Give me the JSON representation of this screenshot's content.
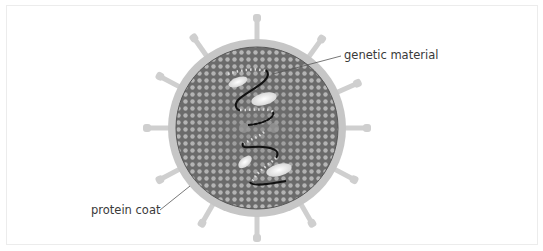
{
  "diagram": {
    "type": "labeled-illustration",
    "labels": [
      {
        "id": "genetic-material",
        "text": "genetic material"
      },
      {
        "id": "protein-coat",
        "text": "protein coat"
      }
    ],
    "colors": {
      "background": "#ffffff",
      "coat": "#c8c8c8",
      "spikes": "#cfcfcf",
      "interior": "#6e6e6e",
      "dots": "#b4b4b4",
      "genetic_strand": "#111111",
      "leader_line": "#555555"
    }
  }
}
